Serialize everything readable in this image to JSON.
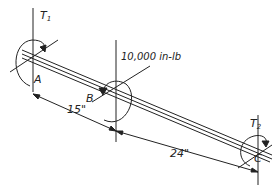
{
  "diagram": {
    "type": "shaft-torsion",
    "labels": {
      "t1": "T",
      "t1_sub": "1",
      "t2": "T",
      "t2_sub": "2",
      "applied_torque": "10,000 in-lb",
      "point_a": "A",
      "point_b": "B",
      "point_c": "C",
      "dim_ab": "15\"",
      "dim_bc": "24\""
    },
    "colors": {
      "line": "#222222",
      "background": "#ffffff"
    }
  }
}
